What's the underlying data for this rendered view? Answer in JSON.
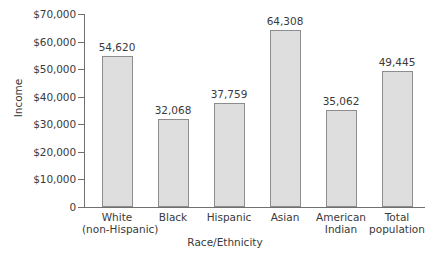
{
  "chart_data": {
    "type": "bar",
    "title": "",
    "xlabel": "Race/Ethnicity",
    "ylabel": "Income",
    "categories": [
      "White\n(non-Hispanic)",
      "Black",
      "Hispanic",
      "Asian",
      "American\nIndian",
      "Total\npopulation"
    ],
    "category_lines": [
      [
        "White",
        "(non-Hispanic)"
      ],
      [
        "Black",
        ""
      ],
      [
        "Hispanic",
        ""
      ],
      [
        "Asian",
        ""
      ],
      [
        "American",
        "Indian"
      ],
      [
        "Total",
        "population"
      ]
    ],
    "values": [
      54620,
      32068,
      37759,
      64308,
      35062,
      49445
    ],
    "value_labels": [
      "54,620",
      "32,068",
      "37,759",
      "64,308",
      "35,062",
      "49,445"
    ],
    "ylim": [
      0,
      70000
    ],
    "yticks": [
      0,
      10000,
      20000,
      30000,
      40000,
      50000,
      60000,
      70000
    ],
    "ytick_labels": [
      "0",
      "$10,000",
      "$20,000",
      "$30,000",
      "$40,000",
      "$50,000",
      "$60,000",
      "$70,000"
    ],
    "grid": false,
    "legend": false,
    "bar_color": "#dedede",
    "bar_border_color": "#8d8d8d",
    "axis_color": "#6f6f6f",
    "text_color": "#3a3a3a"
  }
}
